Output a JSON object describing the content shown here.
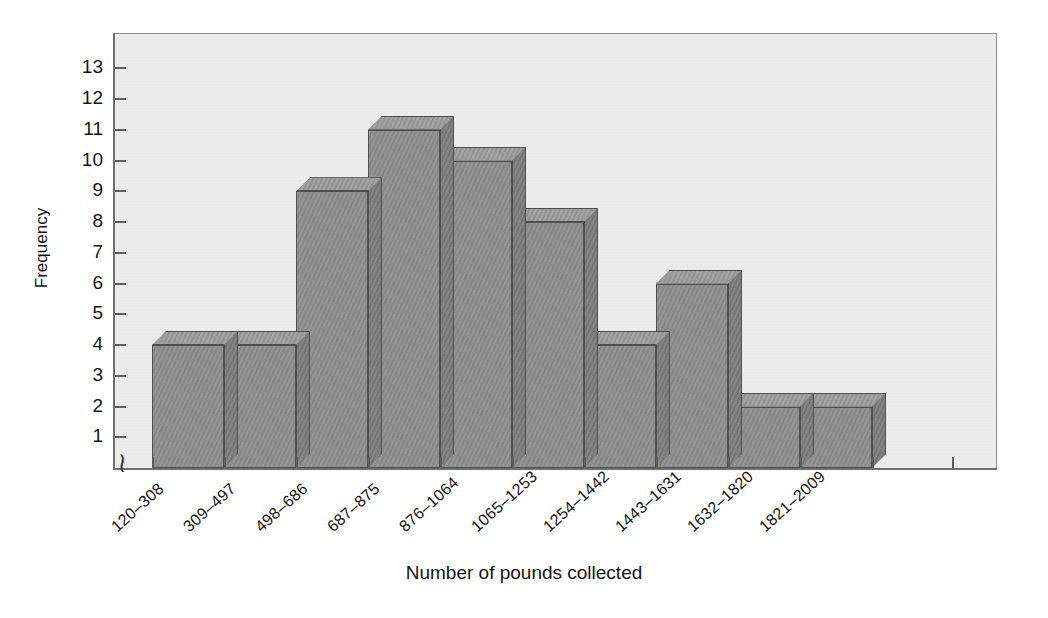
{
  "chart_data": {
    "type": "bar",
    "title": "",
    "subtitle": "",
    "xlabel": "Number of pounds collected",
    "ylabel": "Frequency",
    "categories": [
      "120–308",
      "309–497",
      "498–686",
      "687–875",
      "876–1064",
      "1065–1253",
      "1254–1442",
      "1443–1631",
      "1632–1820",
      "1821–2009"
    ],
    "values": [
      4,
      4,
      9,
      11,
      10,
      8,
      4,
      6,
      2,
      2
    ],
    "ylim": [
      0,
      13
    ],
    "ytick_labels": [
      "1",
      "2",
      "3",
      "4",
      "5",
      "6",
      "7",
      "8",
      "9",
      "10",
      "11",
      "12",
      "13"
    ],
    "ytick_values": [
      1,
      2,
      3,
      4,
      5,
      6,
      7,
      8,
      9,
      10,
      11,
      12,
      13
    ],
    "grid": false,
    "legend": null,
    "legend_position": "none",
    "axis_break": "≈",
    "style": {
      "bar_front_color": "#8d8d8d",
      "bar_top_color": "#9a9a9a",
      "bar_side_color": "#7d7d7d",
      "bar_outline_color": "#4f4f4f",
      "panel_background": "#ededed",
      "panel_border": "#8d8d8d",
      "axis_color": "#6f6f6f",
      "text_color": "#141414",
      "three_d": true
    }
  },
  "axis": {
    "y_title": "Frequency",
    "x_title": "Number of pounds collected",
    "break_symbol": "≀"
  }
}
